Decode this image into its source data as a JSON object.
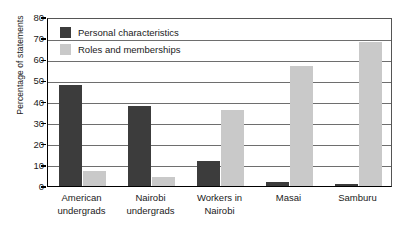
{
  "chart_data": {
    "type": "bar",
    "title": "",
    "xlabel": "",
    "ylabel": "Percentage of statements",
    "ylim": [
      0,
      80
    ],
    "ytick_step": 10,
    "yticks": [
      80,
      70,
      60,
      50,
      40,
      30,
      20,
      10,
      0
    ],
    "grid": "horizontal",
    "legend_position": "top-left-inside",
    "categories": [
      "American undergrads",
      "Nairobi undergrads",
      "Workers in Nairobi",
      "Masai",
      "Samburu"
    ],
    "category_lines": [
      [
        "American",
        "undergrads"
      ],
      [
        "Nairobi",
        "undergrads"
      ],
      [
        "Workers in",
        "Nairobi"
      ],
      [
        "Masai",
        ""
      ],
      [
        "Samburu",
        ""
      ]
    ],
    "series": [
      {
        "name": "Personal characteristics",
        "color": "#3c3c3c",
        "values": [
          48,
          38,
          12,
          2,
          1
        ]
      },
      {
        "name": "Roles and memberships",
        "color": "#c9c9c9",
        "values": [
          7,
          4.5,
          36,
          57,
          68
        ]
      }
    ]
  },
  "axis": {
    "y_title": "Percentage of statements"
  },
  "legend": {
    "items": [
      {
        "label": "Personal characteristics",
        "swatch": "dark"
      },
      {
        "label": "Roles and memberships",
        "swatch": "light"
      }
    ]
  }
}
